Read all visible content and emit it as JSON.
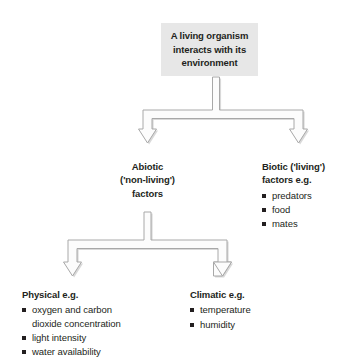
{
  "diagram": {
    "type": "flow-chart",
    "root": {
      "lines": [
        "A living organism",
        "interacts with its",
        "environment"
      ],
      "fill_color": "#e7e7e7"
    },
    "level1": [
      {
        "id": "abiotic",
        "heading_lines": [
          "Abiotic",
          "('non-living')",
          "factors"
        ],
        "align": "center",
        "items": []
      },
      {
        "id": "biotic",
        "heading_lines": [
          "Biotic ('living')",
          "factors e.g."
        ],
        "align": "left",
        "items": [
          "predators",
          "food",
          "mates"
        ]
      }
    ],
    "level2": [
      {
        "id": "physical",
        "heading_lines": [
          "Physical e.g."
        ],
        "align": "left",
        "items": [
          "oxygen and carbon",
          "light intensity",
          "water availability"
        ],
        "item0_wrap": "dioxide concentration"
      },
      {
        "id": "climatic",
        "heading_lines": [
          "Climatic e.g."
        ],
        "align": "left",
        "items": [
          "temperature",
          "humidity"
        ]
      }
    ],
    "arrow_style": {
      "stroke_color": "#a6a6a6",
      "fill_color": "#fbfbfb",
      "shadow_color": "#d0d0d0"
    }
  }
}
